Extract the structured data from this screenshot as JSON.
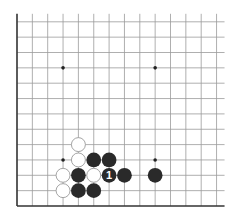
{
  "diagram": {
    "type": "go-board-fragment",
    "corner": "bottom-left",
    "grid": {
      "columns": 14,
      "rows": 13,
      "origin_x": 17,
      "bottom_y": 206,
      "spacing": 15.35,
      "line_extension_right": 8,
      "line_extension_top": 8,
      "line_color": "#9a9a9a",
      "edge_color": "#333333"
    },
    "star_points": [
      {
        "col": 3,
        "row": 9
      },
      {
        "col": 9,
        "row": 9
      },
      {
        "col": 3,
        "row": 3
      },
      {
        "col": 9,
        "row": 3
      }
    ],
    "stones": [
      {
        "color": "white",
        "col": 4,
        "row": 4
      },
      {
        "color": "white",
        "col": 4,
        "row": 3
      },
      {
        "color": "black",
        "col": 5,
        "row": 3
      },
      {
        "color": "black",
        "col": 6,
        "row": 3
      },
      {
        "color": "white",
        "col": 3,
        "row": 2
      },
      {
        "color": "black",
        "col": 4,
        "row": 2
      },
      {
        "color": "white",
        "col": 5,
        "row": 2
      },
      {
        "color": "black",
        "col": 6,
        "row": 2,
        "label": "1"
      },
      {
        "color": "black",
        "col": 7,
        "row": 2
      },
      {
        "color": "black",
        "col": 9,
        "row": 2
      },
      {
        "color": "white",
        "col": 3,
        "row": 1
      },
      {
        "color": "black",
        "col": 4,
        "row": 1
      },
      {
        "color": "black",
        "col": 5,
        "row": 1
      }
    ],
    "colors": {
      "black_stone": "#2a2a2a",
      "white_stone": "#ffffff",
      "white_stroke": "#9a9a9a",
      "label_on_black": "#ffffff"
    }
  }
}
